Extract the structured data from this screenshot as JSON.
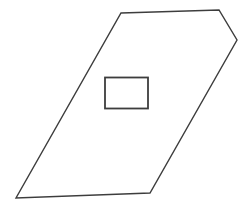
{
  "figure": {
    "canvas": {
      "width": 244,
      "height": 208,
      "background_color": "#ffffff"
    },
    "stroke_color": "#3d3d3d",
    "outer_polygon": {
      "shape": "pentagon (parallelogram with clipped top-right corner)",
      "points": [
        [
          121,
          13
        ],
        [
          219,
          10
        ],
        [
          237,
          40
        ],
        [
          150,
          193
        ],
        [
          16,
          198
        ]
      ],
      "stroke_width": 1.4,
      "fill": "none"
    },
    "inner_rectangle": {
      "shape": "rectangle",
      "x": 105,
      "y": 77.5,
      "width": 43,
      "height": 31,
      "stroke_width": 1.8,
      "fill": "none"
    }
  }
}
